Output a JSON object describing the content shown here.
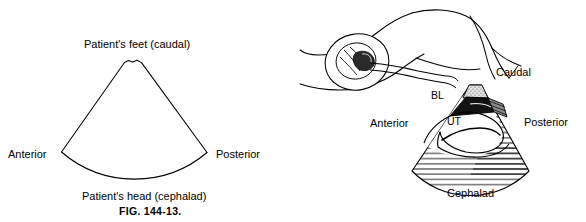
{
  "figure": {
    "caption": "FIG. 144-13.",
    "panels": [
      {
        "id": "left-panel",
        "kind": "ultrasound-sector-orientation-diagram",
        "labels": {
          "top": "Patient's feet (caudal)",
          "left": "Anterior",
          "right": "Posterior",
          "bottom": "Patient's head (cephalad)"
        }
      },
      {
        "id": "right-panel",
        "kind": "transvaginal-probe-anatomy-diagram",
        "labels": {
          "top_right": "Caudal",
          "left": "Anterior",
          "right": "Posterior",
          "bottom": "Cephalad",
          "bladder": "BL",
          "uterus": "UT"
        },
        "icon_names": [
          "patient-legs-icon",
          "transvaginal-probe-icon",
          "ultrasound-sector-icon",
          "bladder-region-icon",
          "uterus-region-icon",
          "hatched-tissue-icon"
        ]
      }
    ]
  },
  "colors": {
    "ink": "#000000",
    "background": "#ffffff",
    "fill_dark": "#1a1a1a",
    "fill_mid": "#555555",
    "fill_light": "#bdbdbd"
  }
}
